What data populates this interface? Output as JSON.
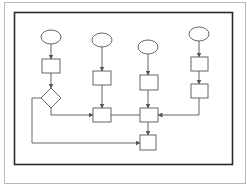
{
  "diagram": {
    "type": "flowchart",
    "colors": {
      "outer_frame": "#b8b8b8",
      "inner_frame": "#2a2a2a",
      "stroke": "#555555",
      "background": "#ffffff"
    },
    "frames": {
      "outer": {
        "x": 4,
        "y": 2,
        "w": 241,
        "h": 181
      },
      "inner": {
        "x": 14,
        "y": 12,
        "w": 218,
        "h": 152
      }
    },
    "nodes": [
      {
        "id": "start-1",
        "shape": "ellipse",
        "cx": 51,
        "cy": 37,
        "rx": 10,
        "ry": 7
      },
      {
        "id": "process-1a",
        "shape": "rect",
        "x": 42,
        "y": 59,
        "w": 18,
        "h": 14
      },
      {
        "id": "decision-1",
        "shape": "diamond",
        "cx": 51,
        "cy": 98,
        "r": 10
      },
      {
        "id": "start-2",
        "shape": "ellipse",
        "cx": 102,
        "cy": 40,
        "rx": 10,
        "ry": 7
      },
      {
        "id": "process-2a",
        "shape": "rect",
        "x": 93,
        "y": 71,
        "w": 18,
        "h": 14
      },
      {
        "id": "process-2b",
        "shape": "rect",
        "x": 93,
        "y": 108,
        "w": 18,
        "h": 14
      },
      {
        "id": "start-3",
        "shape": "ellipse",
        "cx": 148,
        "cy": 47,
        "rx": 10,
        "ry": 7
      },
      {
        "id": "process-3a",
        "shape": "rect",
        "x": 140,
        "y": 75,
        "w": 18,
        "h": 15
      },
      {
        "id": "process-3b",
        "shape": "rect",
        "x": 140,
        "y": 108,
        "w": 18,
        "h": 14
      },
      {
        "id": "end-process",
        "shape": "rect",
        "x": 140,
        "y": 135,
        "w": 16,
        "h": 15
      },
      {
        "id": "start-4",
        "shape": "ellipse",
        "cx": 199,
        "cy": 34,
        "rx": 10,
        "ry": 7
      },
      {
        "id": "process-4a",
        "shape": "rect",
        "x": 191,
        "y": 57,
        "w": 17,
        "h": 14
      },
      {
        "id": "process-4b",
        "shape": "rect",
        "x": 191,
        "y": 84,
        "w": 17,
        "h": 14
      }
    ],
    "edges": [
      {
        "id": "e1",
        "points": [
          [
            51,
            44
          ],
          [
            51,
            59
          ]
        ],
        "arrow": true
      },
      {
        "id": "e2",
        "points": [
          [
            51,
            73
          ],
          [
            51,
            88
          ]
        ],
        "arrow": true
      },
      {
        "id": "e3",
        "points": [
          [
            51,
            108
          ],
          [
            51,
            115
          ],
          [
            93,
            115
          ]
        ],
        "arrow": true
      },
      {
        "id": "e4",
        "points": [
          [
            41,
            98
          ],
          [
            32,
            98
          ],
          [
            32,
            143
          ],
          [
            140,
            143
          ]
        ],
        "arrow": true
      },
      {
        "id": "e5",
        "points": [
          [
            102,
            47
          ],
          [
            102,
            71
          ]
        ],
        "arrow": true
      },
      {
        "id": "e6",
        "points": [
          [
            102,
            85
          ],
          [
            102,
            108
          ]
        ],
        "arrow": true
      },
      {
        "id": "e7",
        "points": [
          [
            111,
            115
          ],
          [
            140,
            115
          ]
        ],
        "arrow": false
      },
      {
        "id": "e8",
        "points": [
          [
            148,
            54
          ],
          [
            148,
            75
          ]
        ],
        "arrow": true
      },
      {
        "id": "e9",
        "points": [
          [
            148,
            90
          ],
          [
            148,
            108
          ]
        ],
        "arrow": true
      },
      {
        "id": "e10",
        "points": [
          [
            148,
            122
          ],
          [
            148,
            135
          ]
        ],
        "arrow": true
      },
      {
        "id": "e11",
        "points": [
          [
            199,
            41
          ],
          [
            199,
            57
          ]
        ],
        "arrow": true
      },
      {
        "id": "e12",
        "points": [
          [
            199,
            71
          ],
          [
            199,
            84
          ]
        ],
        "arrow": true
      },
      {
        "id": "e13",
        "points": [
          [
            199,
            98
          ],
          [
            199,
            115
          ],
          [
            158,
            115
          ]
        ],
        "arrow": true
      }
    ]
  }
}
